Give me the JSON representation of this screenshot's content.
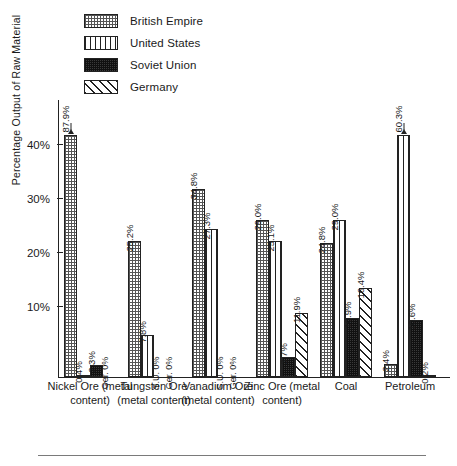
{
  "legend": {
    "items": [
      {
        "label": "British Empire",
        "pattern": "dotted-grid",
        "key": "be"
      },
      {
        "label": "United States",
        "pattern": "vertical-lines",
        "key": "us"
      },
      {
        "label": "Soviet Union",
        "pattern": "dense-dark-grid",
        "key": "su"
      },
      {
        "label": "Germany",
        "pattern": "diagonal-hatch",
        "key": "ge"
      }
    ]
  },
  "axis": {
    "ylabel": "Percentage Output of Raw Material",
    "yticks": [
      "10%",
      "20%",
      "30%",
      "40%"
    ]
  },
  "chart_data": {
    "type": "bar",
    "title": "",
    "xlabel": "",
    "ylabel": "Percentage Output of Raw Material",
    "ylim": [
      0,
      45
    ],
    "ytick_values": [
      10,
      20,
      30,
      40
    ],
    "ytick_labels": [
      "10%",
      "20%",
      "30%",
      "40%"
    ],
    "grid": false,
    "legend_position": "top-left",
    "note": "Bars for British Empire (Nickel Ore 87.9%) and United States (Petroleum 60.3%) exceed the axis range and are drawn clipped with an upward arrow.",
    "categories": [
      "Nickel Ore (metal content)",
      "Tungsten Ore (metal content)",
      "Vanadium Ore (metal content)",
      "Zinc Ore (metal content)",
      "Coal",
      "Petroleum"
    ],
    "series": [
      {
        "name": "British Empire",
        "values": [
          87.9,
          25.2,
          34.8,
          29.0,
          24.8,
          2.4
        ],
        "labels": [
          "87.9%",
          "25.2%",
          "34.8%",
          "29.0%",
          "24.8%",
          "2.4%"
        ]
      },
      {
        "name": "United States",
        "values": [
          0.4,
          7.8,
          27.3,
          25.1,
          29.0,
          60.3
        ],
        "labels": [
          "0.4%",
          "7.8%",
          "27.3%",
          "25.1%",
          "29.0%",
          "60.3%"
        ]
      },
      {
        "name": "Soviet Union",
        "values": [
          2.3,
          0,
          0,
          3.7,
          10.9,
          10.6
        ],
        "labels": [
          "2.3%",
          "S.U. 0%",
          "S.U. 0%",
          "3.7%",
          "10.9%",
          "10.6%"
        ]
      },
      {
        "name": "Germany",
        "values": [
          0,
          0,
          0,
          11.9,
          16.4,
          0.2
        ],
        "labels": [
          "Ger. 0%",
          "Ger. 0%",
          "Ger. 0%",
          "11.9%",
          "16.4%",
          "0.2%"
        ]
      }
    ],
    "clipped": [
      {
        "series": "British Empire",
        "category": "Nickel Ore (metal content)",
        "value": 87.9
      },
      {
        "series": "United States",
        "category": "Petroleum",
        "value": 60.3
      }
    ]
  }
}
